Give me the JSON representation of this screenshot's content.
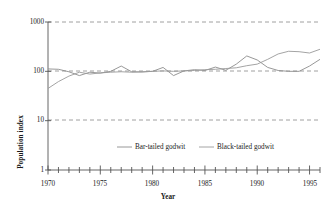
{
  "chart_data": {
    "type": "line",
    "title": "",
    "xlabel": "Year",
    "ylabel": "Population index",
    "y_scale": "log",
    "ylim": [
      1,
      1000
    ],
    "xlim": [
      1970,
      1996
    ],
    "grid": true,
    "grid_style": "dashed-horizontal",
    "legend_position": "inside-bottom-center",
    "y_ticks": [
      {
        "value": 1000,
        "label": "1000"
      },
      {
        "value": 100,
        "label": "100"
      },
      {
        "value": 10,
        "label": "10"
      },
      {
        "value": 1,
        "label": "1"
      }
    ],
    "x_ticks_major": [
      {
        "value": 1970,
        "label": "1970"
      },
      {
        "value": 1975,
        "label": "1975"
      },
      {
        "value": 1980,
        "label": "1980"
      },
      {
        "value": 1985,
        "label": "1985"
      },
      {
        "value": 1990,
        "label": "1990"
      },
      {
        "value": 1995,
        "label": "1995"
      }
    ],
    "x_ticks_minor_step": 1,
    "x": [
      1970,
      1971,
      1972,
      1973,
      1974,
      1975,
      1976,
      1977,
      1978,
      1979,
      1980,
      1981,
      1982,
      1983,
      1984,
      1985,
      1986,
      1987,
      1988,
      1989,
      1990,
      1991,
      1992,
      1993,
      1994,
      1995,
      1996
    ],
    "series": [
      {
        "name": "Bar-tailed godwit",
        "color": "#8c8c8c",
        "values": [
          112,
          110,
          98,
          82,
          96,
          92,
          100,
          128,
          98,
          97,
          100,
          120,
          82,
          102,
          108,
          104,
          122,
          105,
          140,
          205,
          170,
          120,
          104,
          100,
          100,
          128,
          175
        ]
      },
      {
        "name": "Black-tailed godwit",
        "color": "#9a9a9a",
        "values": [
          45,
          62,
          80,
          96,
          88,
          93,
          96,
          98,
          96,
          98,
          100,
          102,
          100,
          102,
          104,
          108,
          110,
          114,
          118,
          130,
          140,
          175,
          225,
          255,
          250,
          235,
          280
        ]
      }
    ]
  },
  "legend": {
    "items": [
      {
        "label": "Bar-tailed godwit",
        "color": "#8c8c8c"
      },
      {
        "label": "Black-tailed godwit",
        "color": "#9a9a9a"
      }
    ]
  },
  "axes": {
    "y_axis_title": "Population index",
    "x_axis_title": "Year"
  },
  "colors": {
    "axis": "#555555",
    "grid": "#888888",
    "text": "#1a1a1a",
    "background": "#ffffff"
  }
}
